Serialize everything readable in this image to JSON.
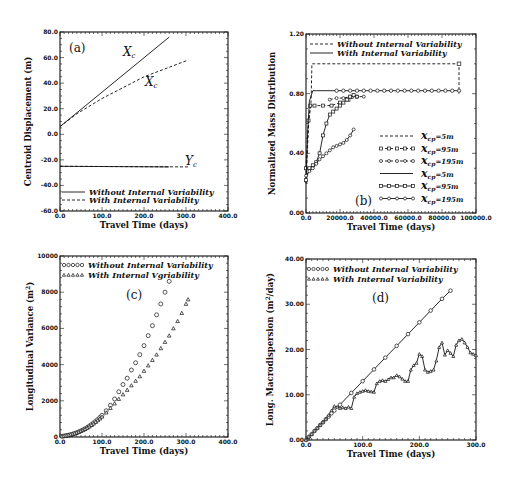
{
  "chart_data": [
    {
      "id": "a",
      "type": "line",
      "panel_label": "(a)",
      "xlabel": "Travel Time (days)",
      "ylabel": "Centroid Displacement (m)",
      "xlim": [
        0,
        400
      ],
      "ylim": [
        -60,
        80
      ],
      "xticks": [
        "0.0",
        "100.0",
        "200.0",
        "300.0",
        "400.0"
      ],
      "yticks": [
        "-60.0",
        "-40.0",
        "-20.0",
        "0.0",
        "20.0",
        "40.0",
        "60.0",
        "80.0"
      ],
      "annotations": [
        "Xc",
        "Xc",
        "Yc"
      ],
      "legend": [
        {
          "label": "Without Internal Variability",
          "style": "solid"
        },
        {
          "label": "With Internal Variability",
          "style": "dashed"
        }
      ],
      "series": [
        {
          "name": "Xc Without Internal Variability",
          "style": "solid",
          "x": [
            0,
            260
          ],
          "y": [
            6,
            76
          ]
        },
        {
          "name": "Xc With Internal Variability",
          "style": "dashed",
          "x": [
            0,
            40,
            100,
            200,
            305
          ],
          "y": [
            6,
            16,
            28,
            45,
            58
          ]
        },
        {
          "name": "Yc Without Internal Variability",
          "style": "solid",
          "x": [
            0,
            260
          ],
          "y": [
            -25,
            -25.5
          ]
        },
        {
          "name": "Yc With Internal Variability",
          "style": "dashed",
          "x": [
            0,
            305
          ],
          "y": [
            -25,
            -25.5
          ]
        }
      ]
    },
    {
      "id": "b",
      "type": "line",
      "panel_label": "(b)",
      "xlabel": "Travel Time (days)",
      "ylabel": "Normalized Mass Distribution",
      "xlim": [
        0,
        100000
      ],
      "ylim": [
        0,
        1.2
      ],
      "xticks": [
        "0.0",
        "20000.0",
        "40000.0",
        "60000.0",
        "80000.0",
        "100000.0"
      ],
      "yticks": [
        "0.00",
        "0.40",
        "0.80",
        "1.20"
      ],
      "legend_header": [
        {
          "label": "Without Internal Variability",
          "style": "dashed"
        },
        {
          "label": "With Internal Variability",
          "style": "solid"
        }
      ],
      "legend": [
        {
          "label": "x_cp=5m",
          "style": "dashed"
        },
        {
          "label": "x_cp=95m",
          "style": "dashed-square"
        },
        {
          "label": "x_cp=195m",
          "style": "dashed-circle"
        },
        {
          "label": "x_cp=5m",
          "style": "solid"
        },
        {
          "label": "x_cp=95m",
          "style": "solid-square"
        },
        {
          "label": "x_cp=195m",
          "style": "solid-circle"
        }
      ],
      "series": [
        {
          "name": "Without x_cp=5m",
          "style": "dashed",
          "x": [
            0,
            1500,
            3000,
            3500,
            5000,
            90000,
            90000
          ],
          "y": [
            0.2,
            0.6,
            0.75,
            1.0,
            1.0,
            1.0,
            0.8
          ]
        },
        {
          "name": "Without x_cp=95m",
          "style": "dashed-square",
          "x": [
            0,
            1500,
            2500,
            5000,
            10000,
            15000,
            20000,
            25000,
            30000
          ],
          "y": [
            0.3,
            0.62,
            0.72,
            0.72,
            0.72,
            0.72,
            0.74,
            0.76,
            0.78
          ]
        },
        {
          "name": "Without x_cp=195m",
          "style": "dashed-circle",
          "x": [
            14000,
            18000,
            22000,
            26000,
            30000,
            34000
          ],
          "y": [
            0.76,
            0.77,
            0.77,
            0.78,
            0.78,
            0.78
          ]
        },
        {
          "name": "With x_cp=5m",
          "style": "solid",
          "x": [
            0,
            1000,
            2000,
            4000,
            6000,
            90000
          ],
          "y": [
            0.2,
            0.55,
            0.75,
            0.82,
            0.82,
            0.82
          ]
        },
        {
          "name": "With x_cp=95m",
          "style": "solid-square",
          "x": [
            0,
            2000,
            4000,
            6000,
            8000,
            10000,
            12000,
            14000,
            16000,
            18000,
            20000,
            22000,
            24000,
            26000,
            28000
          ],
          "y": [
            0.22,
            0.3,
            0.32,
            0.34,
            0.4,
            0.52,
            0.6,
            0.66,
            0.68,
            0.7,
            0.72,
            0.74,
            0.76,
            0.78,
            0.79
          ]
        },
        {
          "name": "With x_cp=195m",
          "style": "solid-circle",
          "x": [
            0,
            2000,
            4000,
            6000,
            8000,
            10000,
            12000,
            14000,
            16000,
            18000,
            20000,
            22000,
            24000,
            26000,
            28000
          ],
          "y": [
            0.25,
            0.28,
            0.3,
            0.33,
            0.36,
            0.38,
            0.4,
            0.42,
            0.44,
            0.45,
            0.46,
            0.47,
            0.49,
            0.52,
            0.56
          ]
        },
        {
          "name": "With x_cp=5m plateau markers",
          "style": "circle-plateau",
          "x": [
            18000,
            22000,
            26000,
            30000,
            34000,
            38000,
            42000,
            46000,
            50000,
            54000,
            58000,
            62000,
            66000,
            70000,
            74000,
            78000,
            82000,
            86000,
            90000
          ],
          "y": [
            0.82,
            0.82,
            0.82,
            0.82,
            0.82,
            0.82,
            0.82,
            0.82,
            0.82,
            0.82,
            0.82,
            0.82,
            0.82,
            0.82,
            0.82,
            0.82,
            0.82,
            0.82,
            0.82
          ]
        }
      ]
    },
    {
      "id": "c",
      "type": "scatter",
      "panel_label": "(c)",
      "xlabel": "Travel Time (days)",
      "ylabel": "Longitudinal Variance (m^2)",
      "xlim": [
        0,
        400
      ],
      "ylim": [
        0,
        10000
      ],
      "xticks": [
        "0.0",
        "100.0",
        "200.0",
        "300.0",
        "400.0"
      ],
      "yticks": [
        "0",
        "2000",
        "4000",
        "6000",
        "8000",
        "10000"
      ],
      "legend": [
        {
          "label": "Without Internal Variability",
          "marker": "circle"
        },
        {
          "label": "With Internal Variability",
          "marker": "triangle"
        }
      ],
      "series": [
        {
          "name": "Without Internal Variability",
          "marker": "circle",
          "x": [
            5,
            10,
            15,
            20,
            25,
            30,
            35,
            40,
            45,
            50,
            55,
            60,
            65,
            70,
            75,
            80,
            85,
            90,
            95,
            100,
            110,
            120,
            130,
            140,
            150,
            160,
            170,
            180,
            190,
            200,
            210,
            220,
            230,
            240,
            250,
            260
          ],
          "y": [
            40,
            60,
            80,
            100,
            130,
            160,
            200,
            240,
            290,
            340,
            400,
            460,
            530,
            610,
            690,
            780,
            870,
            970,
            1080,
            1200,
            1450,
            1750,
            2100,
            2500,
            2900,
            3250,
            3700,
            4100,
            4550,
            5050,
            5600,
            6150,
            6750,
            7350,
            8000,
            8600
          ]
        },
        {
          "name": "With Internal Variability",
          "marker": "triangle",
          "x": [
            5,
            10,
            15,
            20,
            25,
            30,
            35,
            40,
            45,
            50,
            55,
            60,
            65,
            70,
            75,
            80,
            85,
            90,
            95,
            100,
            110,
            120,
            130,
            140,
            150,
            160,
            170,
            180,
            190,
            200,
            210,
            220,
            230,
            240,
            250,
            260,
            270,
            280,
            290,
            300,
            305
          ],
          "y": [
            40,
            60,
            80,
            100,
            130,
            160,
            200,
            240,
            280,
            330,
            380,
            440,
            510,
            580,
            660,
            740,
            830,
            920,
            1020,
            1120,
            1350,
            1600,
            1850,
            2100,
            2350,
            2600,
            2850,
            3100,
            3350,
            3650,
            3950,
            4250,
            4550,
            4900,
            5250,
            5600,
            6000,
            6400,
            6850,
            7350,
            7600
          ]
        }
      ]
    },
    {
      "id": "d",
      "type": "line",
      "panel_label": "(d)",
      "xlabel": "Travel Time (days)",
      "ylabel": "Long. Macrodispersion (m^2/day)",
      "xlim": [
        0,
        300
      ],
      "ylim": [
        0,
        40
      ],
      "xticks": [
        "0.0",
        "100.0",
        "200.0",
        "300.0"
      ],
      "yticks": [
        "0.00",
        "10.00",
        "20.00",
        "30.00",
        "40.00"
      ],
      "legend": [
        {
          "label": "Without Internal Variability",
          "marker": "circle"
        },
        {
          "label": "With Internal Variability",
          "marker": "triangle"
        }
      ],
      "series": [
        {
          "name": "Without Internal Variability",
          "marker": "circle",
          "x": [
            0,
            5,
            10,
            15,
            20,
            25,
            30,
            35,
            40,
            45,
            50,
            60,
            80,
            100,
            120,
            140,
            160,
            180,
            200,
            220,
            240,
            255
          ],
          "y": [
            0,
            0.7,
            1.3,
            2,
            2.6,
            3.3,
            3.9,
            4.6,
            5.2,
            5.9,
            6.5,
            7.8,
            10.4,
            13,
            15.6,
            18.2,
            20.8,
            23.4,
            26,
            28.6,
            31.2,
            33
          ]
        },
        {
          "name": "With Internal Variability",
          "marker": "triangle",
          "x": [
            0,
            5,
            10,
            15,
            20,
            25,
            30,
            35,
            40,
            45,
            50,
            55,
            60,
            65,
            70,
            75,
            80,
            85,
            90,
            95,
            100,
            105,
            110,
            115,
            120,
            125,
            130,
            135,
            140,
            145,
            150,
            155,
            160,
            165,
            170,
            175,
            180,
            185,
            190,
            195,
            200,
            205,
            210,
            215,
            220,
            225,
            230,
            235,
            240,
            245,
            250,
            255,
            260,
            265,
            270,
            275,
            280,
            285,
            290,
            295,
            300
          ],
          "y": [
            0,
            0.7,
            1.3,
            2,
            2.6,
            3.3,
            4,
            4.6,
            5.5,
            6.5,
            7.5,
            7.3,
            7,
            7.2,
            7,
            7.3,
            7,
            9.5,
            10.3,
            10.6,
            10.8,
            11,
            10.8,
            10.7,
            10.6,
            12.5,
            13,
            13.2,
            13,
            13.4,
            13.8,
            13.8,
            14.3,
            14,
            13.5,
            13,
            13,
            15.5,
            16.5,
            17,
            19,
            18.5,
            15.5,
            15,
            15.2,
            15.5,
            17.5,
            20.5,
            21.5,
            18.8,
            19.8,
            19.2,
            18.5,
            21,
            22,
            22.3,
            21.5,
            20.5,
            19.3,
            19,
            18.7
          ]
        }
      ]
    }
  ],
  "labels": {
    "a": {
      "panel": "(a)",
      "xlabel": "Travel Time (days)",
      "ylabel": "Centroid Displacement (m)",
      "ann_xc": "X",
      "ann_sub": "c",
      "ann_yc": "Y",
      "leg1": "Without Internal Variability",
      "leg2": "With Internal Variability"
    },
    "b": {
      "panel": "(b)",
      "xlabel": "Travel Time (days)",
      "ylabel": "Normalized Mass Distribution",
      "leg1": "Without Internal Variability",
      "leg2": "With Internal Variability",
      "xcp": "x",
      "cp": "cp",
      "v5": "=5m",
      "v95": "=95m",
      "v195": "=195m"
    },
    "c": {
      "panel": "(c)",
      "xlabel": "Travel Time (days)",
      "ylabel": "Longitudinal Variance (m",
      "ylabel_sup": "2",
      "ylabel_end": ")",
      "leg1": "Without Internal Variability",
      "leg2": "With Internal Vgriability"
    },
    "d": {
      "panel": "(d)",
      "xlabel": "Travel Time (days)",
      "ylabel": "Long. Macrodispersion (m",
      "ylabel_sup": "2",
      "ylabel_end": "/day)",
      "leg1": "Without Internal Variability",
      "leg2": "With Internal Variability"
    }
  }
}
